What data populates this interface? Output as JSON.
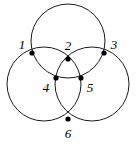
{
  "figure": {
    "canvas": {
      "width": 138,
      "height": 148
    },
    "style": {
      "background_color": "#ffffff",
      "stroke_color": "#1a1a1a",
      "dot_color": "#000000",
      "label_color": "#000000",
      "stroke_width": 1,
      "dot_radius": 2.6,
      "label_font_size": 13
    },
    "circles": [
      {
        "id": "top-circle",
        "name": "top circle",
        "cx": 68,
        "cy": 41,
        "r": 37
      },
      {
        "id": "left-circle",
        "name": "left circle",
        "cx": 44,
        "cy": 84,
        "r": 37
      },
      {
        "id": "right-circle",
        "name": "right circle",
        "cx": 92,
        "cy": 84,
        "r": 37
      }
    ],
    "points": [
      {
        "id": "p1",
        "label": "1",
        "x": 32,
        "y": 53,
        "label_x": 22,
        "label_y": 46,
        "circles": [
          "top-circle",
          "left-circle"
        ]
      },
      {
        "id": "p2",
        "label": "2",
        "x": 68,
        "y": 59,
        "label_x": 68,
        "label_y": 47,
        "circles": [
          "left-circle",
          "right-circle"
        ]
      },
      {
        "id": "p3",
        "label": "3",
        "x": 104,
        "y": 53,
        "label_x": 114,
        "label_y": 46,
        "circles": [
          "top-circle",
          "right-circle"
        ]
      },
      {
        "id": "p4",
        "label": "4",
        "x": 56,
        "y": 78,
        "label_x": 46,
        "label_y": 89,
        "circles": [
          "top-circle",
          "right-circle"
        ]
      },
      {
        "id": "p5",
        "label": "5",
        "x": 81,
        "y": 78,
        "label_x": 90,
        "label_y": 89,
        "circles": [
          "top-circle",
          "left-circle"
        ]
      },
      {
        "id": "p6",
        "label": "6",
        "x": 68,
        "y": 119,
        "label_x": 68,
        "label_y": 135,
        "circles": [
          "left-circle",
          "right-circle"
        ]
      }
    ],
    "labels": [
      "1",
      "2",
      "3",
      "4",
      "5",
      "6"
    ]
  }
}
